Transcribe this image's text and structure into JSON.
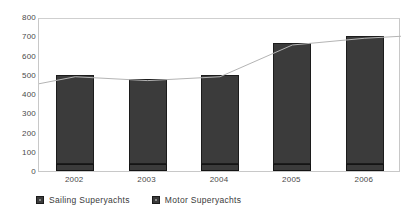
{
  "chart_data": {
    "type": "bar",
    "stacked": true,
    "title": "",
    "subtitle": "",
    "xlabel": "",
    "ylabel": "",
    "categories": [
      "2002",
      "2003",
      "2004",
      "2005",
      "2006"
    ],
    "series": [
      {
        "name": "Sailing Superyachts",
        "values": [
          35,
          35,
          35,
          35,
          35
        ],
        "color": "#3b3b3b"
      },
      {
        "name": "Motor Superyachts",
        "values": [
          465,
          445,
          465,
          630,
          665
        ],
        "color": "#3b3b3b"
      }
    ],
    "totals": [
      500,
      480,
      500,
      665,
      700
    ],
    "ylim": [
      0,
      800
    ],
    "ytick_step": 100,
    "ytick_labels": [
      "800",
      "700",
      "600",
      "500",
      "400",
      "300",
      "200",
      "100",
      "0"
    ],
    "ytick_values": [
      800,
      700,
      600,
      500,
      400,
      300,
      200,
      100,
      0
    ],
    "grid": false,
    "legend_position": "bottom-left",
    "trend_line": {
      "name": "total-trend-line",
      "values": [
        500,
        480,
        500,
        665,
        700
      ],
      "color": "#b4b4b4"
    }
  },
  "legend": {
    "entries": [
      {
        "label": "Sailing Superyachts",
        "swatch_name": "legend-swatch-sailing"
      },
      {
        "label": "Motor Superyachts",
        "swatch_name": "legend-swatch-motor"
      }
    ]
  },
  "colors": {
    "bar_fill": "#3b3b3b",
    "bar_border": "#1a1a1a",
    "plot_border": "#c8c8c8",
    "axis_text": "#4a4a4a",
    "trend_line": "#b4b4b4",
    "background": "#ffffff"
  }
}
